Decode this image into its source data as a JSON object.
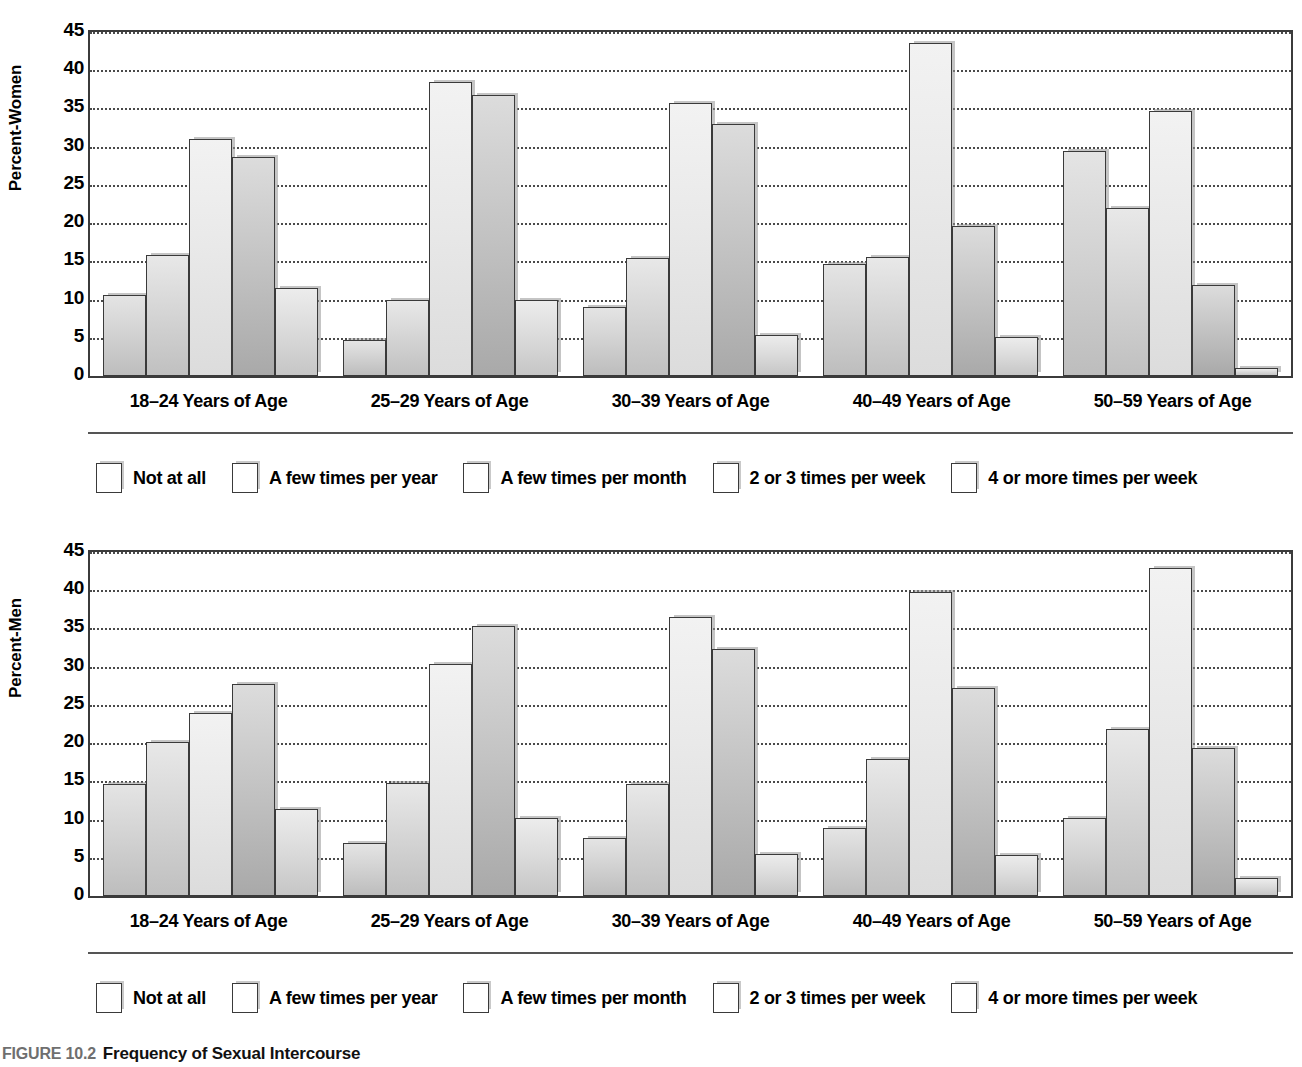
{
  "caption": {
    "number": "FIGURE 10.2",
    "title": "Frequency of Sexual Intercourse"
  },
  "legend": {
    "items": [
      "Not at all",
      "A few times per year",
      "A few times per month",
      "2 or 3 times per week",
      "4 or more times per week"
    ]
  },
  "chart_data": [
    {
      "type": "bar",
      "title": "Frequency of Sexual Intercourse — Women",
      "xlabel": "",
      "ylabel": "Percent-Women",
      "ylim": [
        0,
        45
      ],
      "yticks": [
        0,
        5,
        10,
        15,
        20,
        25,
        30,
        35,
        40,
        45
      ],
      "grid": true,
      "legend_position": "below",
      "categories": [
        "18–24 Years of Age",
        "25–29 Years of Age",
        "30–39 Years of Age",
        "40–49 Years of Age",
        "50–59 Years of Age"
      ],
      "series": [
        {
          "name": "Not at all",
          "values": [
            10.6,
            4.7,
            9.0,
            14.6,
            29.5
          ]
        },
        {
          "name": "A few times per year",
          "values": [
            15.8,
            9.9,
            15.5,
            15.6,
            22.0
          ]
        },
        {
          "name": "A few times per month",
          "values": [
            31.0,
            38.4,
            35.7,
            43.6,
            34.7
          ]
        },
        {
          "name": "2 or 3 times per week",
          "values": [
            28.6,
            36.8,
            33.0,
            19.6,
            11.9
          ]
        },
        {
          "name": "4 or more times per week",
          "values": [
            11.5,
            9.9,
            5.4,
            5.1,
            1.0
          ]
        }
      ]
    },
    {
      "type": "bar",
      "title": "Frequency of Sexual Intercourse — Men",
      "xlabel": "",
      "ylabel": "Percent-Men",
      "ylim": [
        0,
        45
      ],
      "yticks": [
        0,
        5,
        10,
        15,
        20,
        25,
        30,
        35,
        40,
        45
      ],
      "grid": true,
      "legend_position": "below",
      "categories": [
        "18–24 Years of Age",
        "25–29 Years of Age",
        "30–39 Years of Age",
        "40–49 Years of Age",
        "50–59 Years of Age"
      ],
      "series": [
        {
          "name": "Not at all",
          "values": [
            14.7,
            6.9,
            7.6,
            8.9,
            10.2
          ]
        },
        {
          "name": "A few times per year",
          "values": [
            20.2,
            14.8,
            14.7,
            17.9,
            21.9
          ]
        },
        {
          "name": "A few times per month",
          "values": [
            24.0,
            30.4,
            36.5,
            39.8,
            42.9
          ]
        },
        {
          "name": "2 or 3 times per week",
          "values": [
            27.8,
            35.3,
            32.3,
            27.2,
            19.4
          ]
        },
        {
          "name": "4 or more times per week",
          "values": [
            11.4,
            10.2,
            5.5,
            5.4,
            2.3
          ]
        }
      ]
    }
  ]
}
